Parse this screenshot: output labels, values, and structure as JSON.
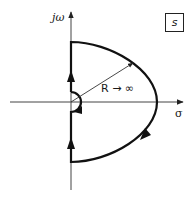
{
  "diagram": {
    "plane_label": "s",
    "axes": {
      "imaginary_label": "jω",
      "real_label": "σ"
    },
    "radius_label": "R → ∞",
    "colors": {
      "contour": "#111111",
      "axis": "#444444",
      "text": "#1a1a1a"
    }
  }
}
